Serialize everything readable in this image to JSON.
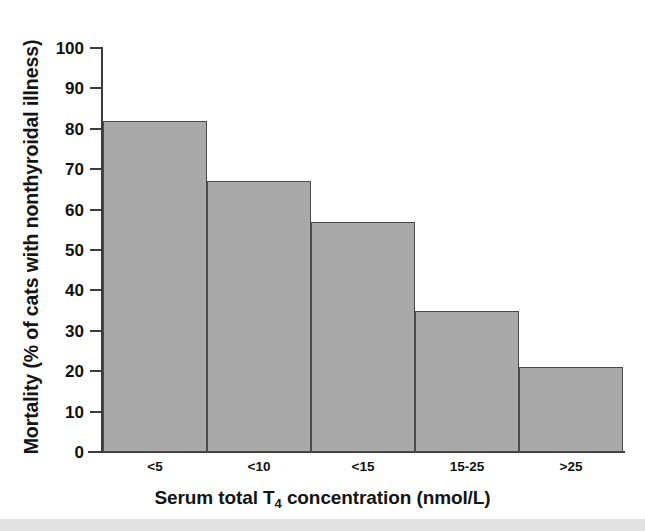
{
  "chart_data": {
    "type": "bar",
    "title": "",
    "subtitle": "",
    "categories": [
      "<5",
      "<10",
      "<15",
      "15-25",
      ">25"
    ],
    "values": [
      82,
      67,
      57,
      35,
      21
    ],
    "series": [
      {
        "name": "Mortality",
        "values": [
          82,
          67,
          57,
          35,
          21
        ]
      }
    ],
    "xlabel": "Serum total T4 concentration (nmol/L)",
    "xlabel_parts": {
      "before": "Serum total T",
      "subscript": "4",
      "after": " concentration (nmol/L)"
    },
    "ylabel": "Mortality (% of cats with nonthyroidal illness)",
    "ylim": [
      0,
      100
    ],
    "yticks": [
      0,
      10,
      20,
      30,
      40,
      50,
      60,
      70,
      80,
      90,
      100
    ],
    "ytick_labels": [
      "0",
      "10",
      "20",
      "30",
      "40",
      "50",
      "60",
      "70",
      "80",
      "90",
      "100"
    ],
    "grid": false,
    "legend": false,
    "legend_position": "none",
    "bar_gap": 0,
    "colors": {
      "bar_fill": "#a9a9a9",
      "bar_edge": "#4a4a4a",
      "axis": "#3c3c3c",
      "text": "#111111",
      "background": "#ffffff"
    }
  }
}
